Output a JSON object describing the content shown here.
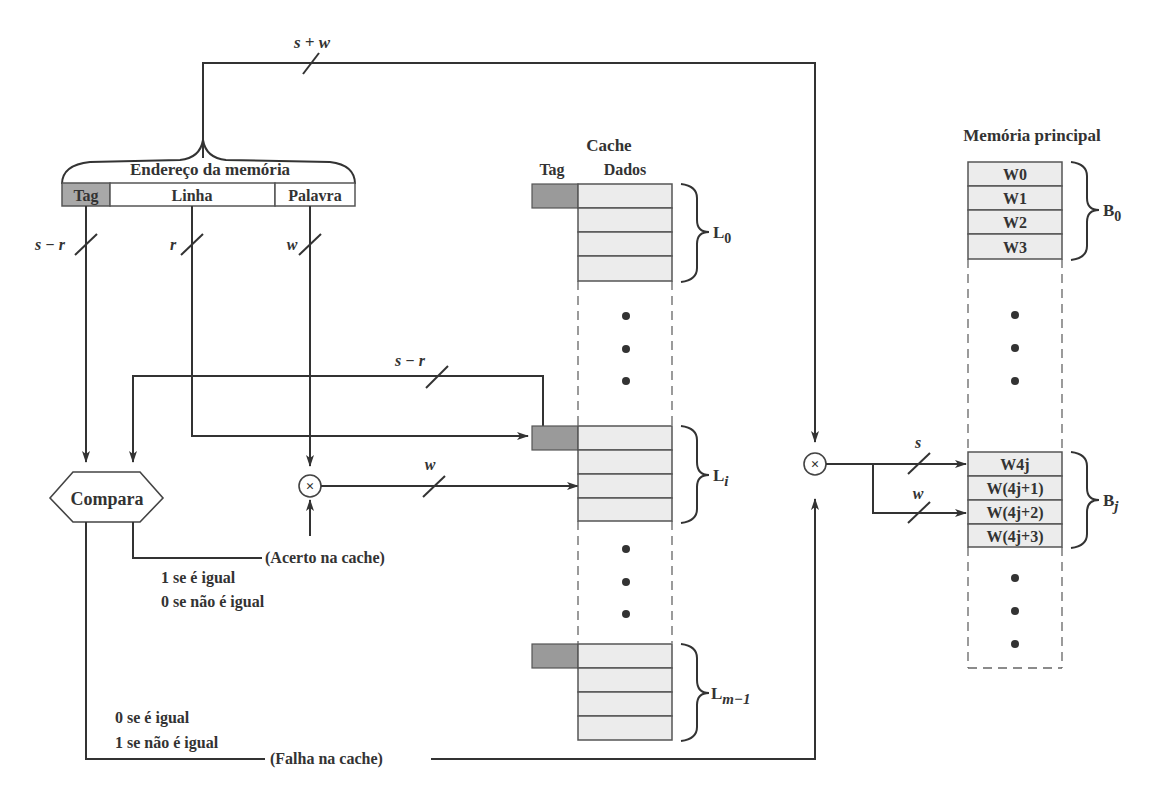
{
  "diagram": {
    "address": {
      "title": "Endereço da memória",
      "fields": [
        {
          "label": "Tag",
          "bits": "s − r"
        },
        {
          "label": "Linha",
          "bits": "r"
        },
        {
          "label": "Palavra",
          "bits": "w"
        }
      ],
      "total_bits": "s + w"
    },
    "cache": {
      "title": "Cache",
      "col_tag": "Tag",
      "col_data": "Dados",
      "lines": [
        {
          "label": "L",
          "sub": "0"
        },
        {
          "label": "L",
          "sub": "i"
        },
        {
          "label": "L",
          "sub": "m−1"
        }
      ],
      "tag_path_bits": "s − r",
      "word_path_bits": "w"
    },
    "main_memory": {
      "title": "Memória principal",
      "block0": {
        "words": [
          "W0",
          "W1",
          "W2",
          "W3"
        ],
        "label": "B",
        "sub": "0"
      },
      "blockj": {
        "words": [
          "W4j",
          "W(4j+1)",
          "W(4j+2)",
          "W(4j+3)"
        ],
        "label": "B",
        "sub": "j"
      },
      "s_bits": "s",
      "w_bits": "w"
    },
    "compare": {
      "label": "Compara",
      "hit_label": "(Acerto na cache)",
      "hit_rule_1": "1 se é igual",
      "hit_rule_2": "0 se não é igual",
      "miss_label": "(Falha na cache)",
      "miss_rule_1": "0 se é igual",
      "miss_rule_2": "1 se não é igual"
    },
    "mux_symbol": "×",
    "ellipsis_dot": "•"
  }
}
